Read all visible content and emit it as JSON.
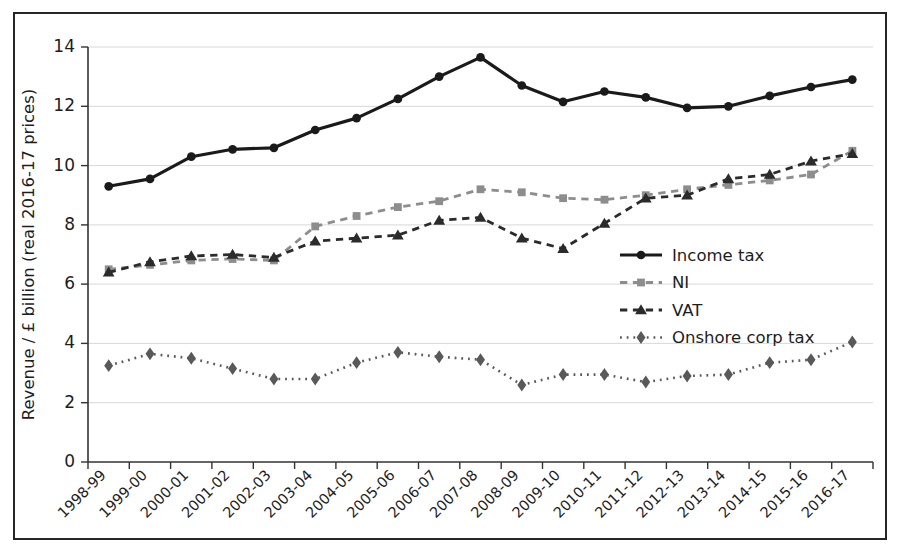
{
  "chart_data": {
    "type": "line",
    "title": "",
    "xlabel": "",
    "ylabel": "Revenue / £ billion (real 2016-17 prices)",
    "ylim": [
      0,
      14
    ],
    "yticks": [
      0,
      2,
      4,
      6,
      8,
      10,
      12,
      14
    ],
    "ytick_labels": [
      "0",
      "2",
      "4",
      "6",
      "8",
      "10",
      "12",
      "14"
    ],
    "grid": true,
    "legend_position": "center-right",
    "categories": [
      "1998-99",
      "1999-00",
      "2000-01",
      "2001-02",
      "2002-03",
      "2003-04",
      "2004-05",
      "2005-06",
      "2006-07",
      "2007-08",
      "2008-09",
      "2009-10",
      "2010-11",
      "2011-12",
      "2012-13",
      "2013-14",
      "2014-15",
      "2015-16",
      "2016-17"
    ],
    "series": [
      {
        "name": "Income tax",
        "marker": "circle",
        "linestyle": "solid",
        "color": "#1a1a1a",
        "values": [
          9.3,
          9.55,
          10.3,
          10.55,
          10.6,
          11.2,
          11.6,
          12.25,
          13.0,
          13.65,
          12.7,
          12.15,
          12.5,
          12.3,
          11.95,
          12.0,
          12.35,
          12.65,
          12.9
        ]
      },
      {
        "name": "NI",
        "marker": "square",
        "linestyle": "dashed",
        "color": "#8d8d8d",
        "values": [
          6.5,
          6.65,
          6.8,
          6.85,
          6.8,
          7.95,
          8.3,
          8.6,
          8.8,
          9.2,
          9.1,
          8.9,
          8.85,
          9.0,
          9.2,
          9.35,
          9.5,
          9.7,
          10.5
        ]
      },
      {
        "name": "VAT",
        "marker": "triangle",
        "linestyle": "dashed",
        "color": "#2b2b2b",
        "values": [
          6.4,
          6.75,
          6.95,
          7.0,
          6.9,
          7.45,
          7.55,
          7.65,
          8.15,
          8.25,
          7.55,
          7.2,
          8.05,
          8.9,
          9.0,
          9.55,
          9.7,
          10.15,
          10.4
        ]
      },
      {
        "name": "Onshore corp tax",
        "marker": "diamond",
        "linestyle": "dotted",
        "color": "#595959",
        "values": [
          3.25,
          3.65,
          3.5,
          3.15,
          2.8,
          2.8,
          3.35,
          3.7,
          3.55,
          3.45,
          2.6,
          2.95,
          2.95,
          2.7,
          2.9,
          2.95,
          3.35,
          3.45,
          4.05
        ]
      }
    ]
  }
}
